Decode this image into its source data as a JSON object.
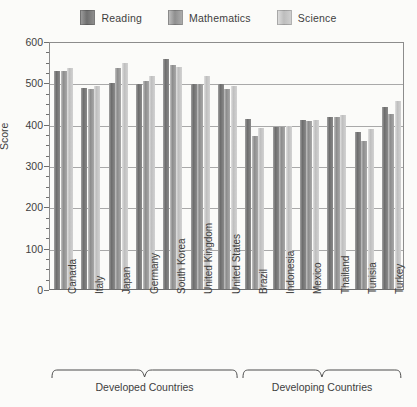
{
  "chart_data": {
    "type": "bar",
    "title": "",
    "xlabel": "",
    "ylabel": "Score",
    "ylim": [
      0,
      600
    ],
    "ytick_step": 100,
    "yticks": [
      0,
      100,
      200,
      300,
      400,
      500,
      600
    ],
    "grid": true,
    "legend_position": "top-center",
    "categories": [
      "Canada",
      "Italy",
      "Japan",
      "Germany",
      "South Korea",
      "United Kingdom",
      "United States",
      "Brazil",
      "Indonesia",
      "Mexico",
      "Thailand",
      "Tunisia",
      "Turkey"
    ],
    "series": [
      {
        "name": "Reading",
        "color": "#6d6d6d",
        "values": [
          528,
          487,
          498,
          495,
          556,
          496,
          495,
          412,
          393,
          410,
          417,
          380,
          441
        ]
      },
      {
        "name": "Mathematics",
        "color": "#8d8d8d",
        "values": [
          527,
          484,
          534,
          503,
          542,
          495,
          483,
          370,
          391,
          406,
          417,
          359,
          423
        ]
      },
      {
        "name": "Science",
        "color": "#bfbfbf",
        "values": [
          534,
          491,
          548,
          516,
          538,
          515,
          491,
          390,
          395,
          410,
          421,
          386,
          454
        ]
      }
    ],
    "groups": [
      {
        "label": "Developed Countries",
        "categories": [
          "Canada",
          "Italy",
          "Japan",
          "Germany",
          "South Korea",
          "United Kingdom",
          "United States"
        ]
      },
      {
        "label": "Developing Countries",
        "categories": [
          "Brazil",
          "Indonesia",
          "Mexico",
          "Thailand",
          "Tunisia",
          "Turkey"
        ]
      }
    ]
  },
  "legend": {
    "items": [
      {
        "label": "Reading",
        "swatch": "reading-swatch-icon"
      },
      {
        "label": "Mathematics",
        "swatch": "mathematics-swatch-icon"
      },
      {
        "label": "Science",
        "swatch": "science-swatch-icon"
      }
    ]
  },
  "axis": {
    "y_label": "Score",
    "y_ticks": [
      "600",
      "500",
      "400",
      "300",
      "200",
      "100",
      "0"
    ]
  },
  "group_braces": [
    {
      "label": "Developed Countries"
    },
    {
      "label": "Developing Countries"
    }
  ]
}
